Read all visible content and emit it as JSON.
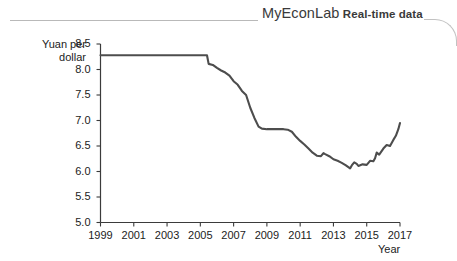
{
  "header": {
    "brand": "MyEconLab",
    "subtitle": "Real-time data",
    "rule_left_name": "header-rule-left",
    "rule_right_name": "header-rule-right"
  },
  "chart_data": {
    "type": "line",
    "title": "",
    "xlabel": "Year",
    "ylabel": "Yuan per dollar",
    "ylabel_lines": [
      "Yuan per",
      "dollar"
    ],
    "xlim": [
      1999,
      2017
    ],
    "ylim": [
      5.0,
      8.5
    ],
    "grid": false,
    "legend": null,
    "yticks": [
      "5.0",
      "5.5",
      "6.0",
      "6.5",
      "7.0",
      "7.5",
      "8.0",
      "8.5"
    ],
    "ytick_values": [
      5.0,
      5.5,
      6.0,
      6.5,
      7.0,
      7.5,
      8.0,
      8.5
    ],
    "xticks": [
      "1999",
      "2001",
      "2003",
      "2005",
      "2007",
      "2009",
      "2011",
      "2013",
      "2015",
      "2017"
    ],
    "xtick_values": [
      1999,
      2001,
      2003,
      2005,
      2007,
      2009,
      2011,
      2013,
      2015,
      2017
    ],
    "series": [
      {
        "name": "Yuan per dollar exchange rate",
        "color": "#4d4d4d",
        "x": [
          1999.0,
          1999.5,
          2000.0,
          2000.5,
          2001.0,
          2001.5,
          2002.0,
          2002.5,
          2003.0,
          2003.5,
          2004.0,
          2004.5,
          2005.0,
          2005.4,
          2005.5,
          2005.75,
          2006.0,
          2006.25,
          2006.5,
          2006.75,
          2007.0,
          2007.25,
          2007.5,
          2007.75,
          2008.0,
          2008.25,
          2008.5,
          2008.7,
          2009.0,
          2009.25,
          2009.5,
          2009.75,
          2010.0,
          2010.25,
          2010.5,
          2010.75,
          2011.0,
          2011.25,
          2011.5,
          2011.75,
          2012.0,
          2012.25,
          2012.4,
          2012.5,
          2012.75,
          2013.0,
          2013.25,
          2013.5,
          2013.75,
          2014.0,
          2014.1,
          2014.25,
          2014.4,
          2014.5,
          2014.75,
          2015.0,
          2015.2,
          2015.4,
          2015.5,
          2015.6,
          2015.75,
          2016.0,
          2016.2,
          2016.4,
          2016.5,
          2016.6,
          2016.75,
          2016.9,
          2017.0
        ],
        "y": [
          8.28,
          8.28,
          8.28,
          8.28,
          8.28,
          8.28,
          8.28,
          8.28,
          8.28,
          8.28,
          8.28,
          8.28,
          8.28,
          8.28,
          8.11,
          8.09,
          8.03,
          7.98,
          7.94,
          7.88,
          7.77,
          7.7,
          7.58,
          7.5,
          7.25,
          7.05,
          6.88,
          6.84,
          6.83,
          6.83,
          6.83,
          6.83,
          6.83,
          6.82,
          6.78,
          6.68,
          6.6,
          6.53,
          6.45,
          6.37,
          6.31,
          6.3,
          6.36,
          6.34,
          6.3,
          6.24,
          6.21,
          6.17,
          6.12,
          6.06,
          6.12,
          6.18,
          6.15,
          6.11,
          6.14,
          6.13,
          6.21,
          6.2,
          6.26,
          6.37,
          6.33,
          6.45,
          6.52,
          6.5,
          6.56,
          6.62,
          6.7,
          6.83,
          6.95
        ]
      }
    ]
  }
}
